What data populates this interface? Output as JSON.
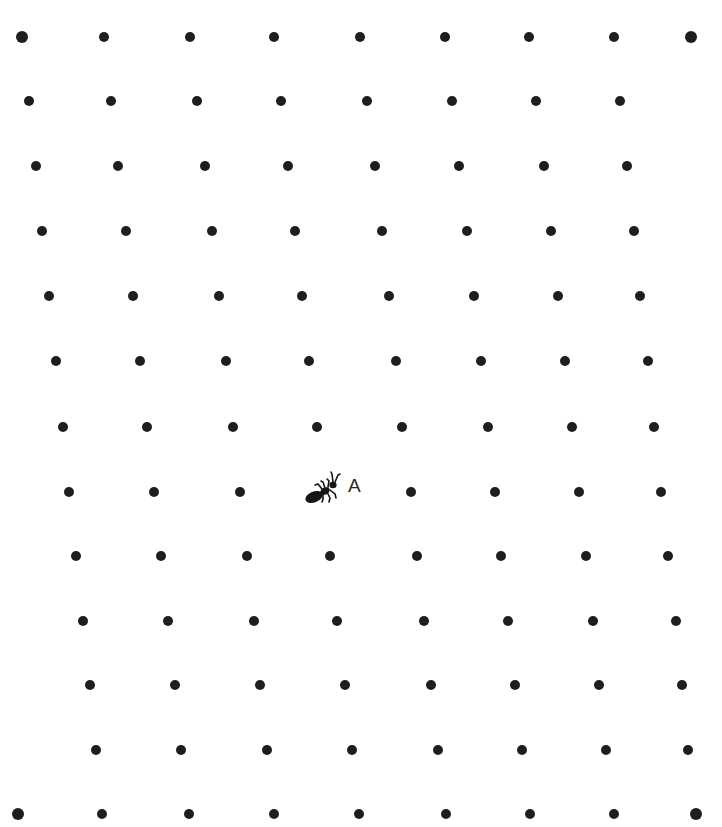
{
  "diagram": {
    "type": "dot-grid",
    "dot_color": "#1e1e1e",
    "background": "#ffffff",
    "rows": [
      {
        "y": 37,
        "xs": [
          22,
          104,
          190,
          274,
          360,
          445,
          529,
          614,
          691
        ]
      },
      {
        "y": 101,
        "xs": [
          29,
          111,
          197,
          281,
          367,
          452,
          536,
          620
        ]
      },
      {
        "y": 166,
        "xs": [
          36,
          118,
          205,
          288,
          375,
          459,
          544,
          627
        ]
      },
      {
        "y": 231,
        "xs": [
          42,
          126,
          212,
          295,
          382,
          467,
          551,
          634
        ]
      },
      {
        "y": 296,
        "xs": [
          49,
          133,
          219,
          302,
          389,
          474,
          558,
          640
        ]
      },
      {
        "y": 361,
        "xs": [
          56,
          140,
          226,
          309,
          396,
          481,
          565,
          648
        ]
      },
      {
        "y": 427,
        "xs": [
          63,
          147,
          233,
          317,
          402,
          488,
          572,
          654
        ]
      },
      {
        "y": 492,
        "xs": [
          69,
          154,
          240,
          411,
          495,
          579,
          661
        ]
      },
      {
        "y": 556,
        "xs": [
          76,
          161,
          247,
          330,
          417,
          501,
          586,
          668
        ]
      },
      {
        "y": 621,
        "xs": [
          83,
          168,
          254,
          337,
          424,
          508,
          593,
          676
        ]
      },
      {
        "y": 685,
        "xs": [
          90,
          175,
          260,
          345,
          431,
          515,
          599,
          682
        ]
      },
      {
        "y": 750,
        "xs": [
          96,
          181,
          267,
          352,
          438,
          522,
          606,
          688
        ]
      },
      {
        "y": 814,
        "xs": [
          18,
          102,
          189,
          274,
          359,
          446,
          530,
          614,
          696
        ]
      }
    ],
    "marker": {
      "icon": "ant-icon",
      "label": "A",
      "row": 8,
      "column": 4,
      "x": 325,
      "y": 490
    }
  }
}
